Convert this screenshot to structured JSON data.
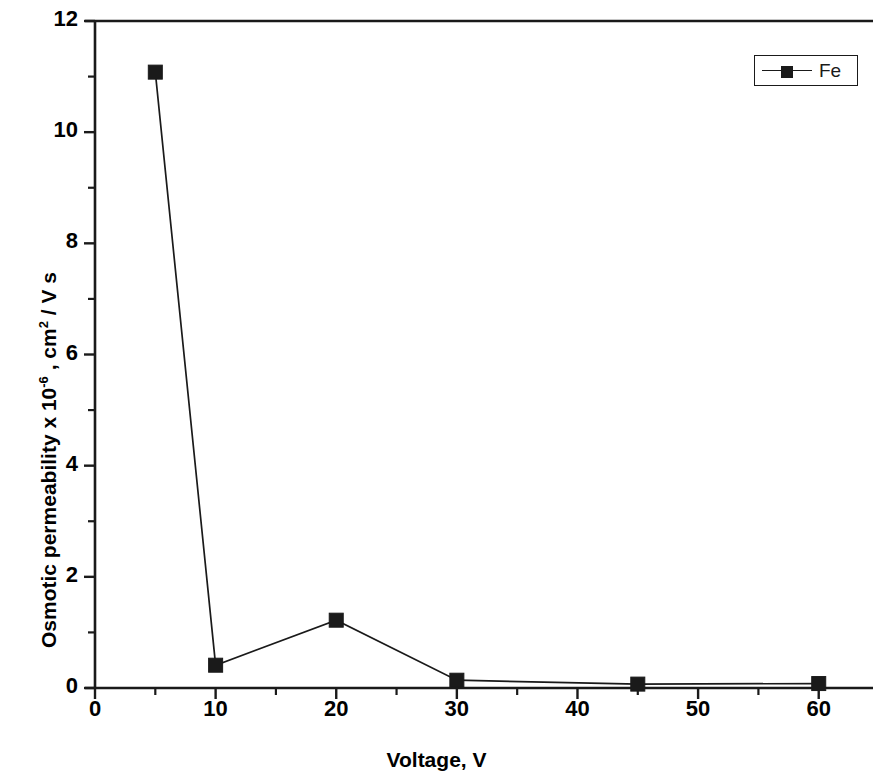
{
  "chart_data": {
    "type": "line",
    "title": "",
    "xlabel": "Voltage, V",
    "ylabel_parts": {
      "pre": "Osmotic permeability x 10",
      "sup1": "-6",
      "mid": " , cm",
      "sup2": "2",
      "post": " / V s"
    },
    "ylabel": "Osmotic permeability x 10-6 , cm2 / V s",
    "xlim": [
      0,
      64.5
    ],
    "ylim": [
      0,
      12
    ],
    "xticks": [
      0,
      10,
      20,
      30,
      40,
      50,
      60
    ],
    "xtick_labels": [
      "0",
      "10",
      "20",
      "30",
      "40",
      "50",
      "60"
    ],
    "x_minor_step": 5,
    "yticks": [
      0,
      2,
      4,
      6,
      8,
      10,
      12
    ],
    "ytick_labels": [
      "0",
      "2",
      "4",
      "6",
      "8",
      "10",
      "12"
    ],
    "y_minor_step": 1,
    "grid": false,
    "legend_position": "top-right",
    "marker": "filled-square",
    "line_color": "#1a1a1a",
    "marker_color": "#1a1a1a",
    "series": [
      {
        "name": "Fe",
        "x": [
          5,
          10,
          20,
          30,
          45,
          60
        ],
        "values": [
          11.08,
          0.41,
          1.22,
          0.14,
          0.07,
          0.08
        ]
      }
    ]
  },
  "legend": {
    "entries": [
      {
        "label": "Fe"
      }
    ]
  }
}
